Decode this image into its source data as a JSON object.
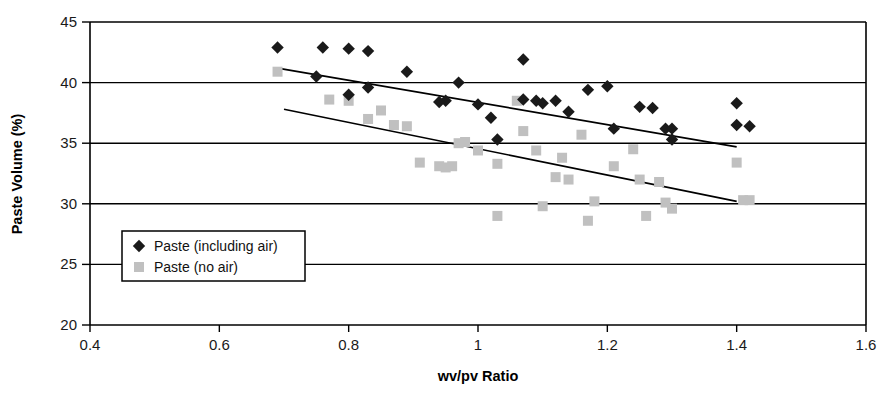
{
  "chart_data": {
    "type": "scatter",
    "title": "",
    "xlabel": "wv/pv Ratio",
    "ylabel": "Paste Volume (%)",
    "xlim": [
      0.4,
      1.6
    ],
    "ylim": [
      20,
      45
    ],
    "xticks": [
      "0.4",
      "0.6",
      "0.8",
      "1",
      "1.2",
      "1.4",
      "1.6"
    ],
    "xtick_values": [
      0.4,
      0.6,
      0.8,
      1.0,
      1.2,
      1.4,
      1.6
    ],
    "yticks": [
      "20",
      "25",
      "30",
      "35",
      "40",
      "45"
    ],
    "ytick_values": [
      20,
      25,
      30,
      35,
      40,
      45
    ],
    "grid": "horizontal",
    "legend_position": "lower-left-inside",
    "series": [
      {
        "name": "Paste (including air)",
        "marker": "diamond",
        "color": "#1a1a1a",
        "points": [
          [
            0.69,
            42.9
          ],
          [
            0.76,
            42.9
          ],
          [
            0.8,
            42.8
          ],
          [
            0.83,
            42.6
          ],
          [
            0.75,
            40.5
          ],
          [
            0.8,
            39.0
          ],
          [
            0.83,
            39.6
          ],
          [
            0.89,
            40.9
          ],
          [
            0.95,
            38.5
          ],
          [
            0.94,
            38.4
          ],
          [
            0.97,
            40.0
          ],
          [
            1.0,
            38.2
          ],
          [
            1.02,
            37.1
          ],
          [
            1.03,
            35.3
          ],
          [
            1.07,
            41.9
          ],
          [
            1.07,
            38.6
          ],
          [
            1.09,
            38.5
          ],
          [
            1.1,
            38.3
          ],
          [
            1.12,
            38.5
          ],
          [
            1.14,
            37.6
          ],
          [
            1.17,
            39.4
          ],
          [
            1.2,
            39.7
          ],
          [
            1.21,
            36.2
          ],
          [
            1.25,
            38.0
          ],
          [
            1.27,
            37.9
          ],
          [
            1.29,
            36.2
          ],
          [
            1.3,
            36.2
          ],
          [
            1.3,
            35.3
          ],
          [
            1.4,
            38.3
          ],
          [
            1.4,
            36.5
          ],
          [
            1.42,
            36.4
          ]
        ]
      },
      {
        "name": "Paste (no air)",
        "marker": "square",
        "color": "#c0c0c0",
        "points": [
          [
            0.69,
            40.9
          ],
          [
            0.77,
            38.6
          ],
          [
            0.8,
            38.5
          ],
          [
            0.83,
            37.0
          ],
          [
            0.85,
            37.7
          ],
          [
            0.87,
            36.5
          ],
          [
            0.89,
            36.4
          ],
          [
            0.91,
            33.4
          ],
          [
            0.94,
            33.1
          ],
          [
            0.95,
            33.0
          ],
          [
            0.96,
            33.1
          ],
          [
            0.97,
            35.0
          ],
          [
            0.98,
            35.1
          ],
          [
            1.0,
            34.4
          ],
          [
            1.03,
            33.3
          ],
          [
            1.03,
            29.0
          ],
          [
            1.06,
            38.5
          ],
          [
            1.07,
            36.0
          ],
          [
            1.09,
            34.4
          ],
          [
            1.1,
            29.8
          ],
          [
            1.12,
            32.2
          ],
          [
            1.13,
            33.8
          ],
          [
            1.14,
            32.0
          ],
          [
            1.16,
            35.7
          ],
          [
            1.17,
            28.6
          ],
          [
            1.18,
            30.2
          ],
          [
            1.21,
            33.1
          ],
          [
            1.24,
            34.5
          ],
          [
            1.25,
            32.0
          ],
          [
            1.26,
            29.0
          ],
          [
            1.28,
            31.8
          ],
          [
            1.29,
            30.1
          ],
          [
            1.3,
            29.6
          ],
          [
            1.4,
            33.4
          ],
          [
            1.41,
            30.3
          ],
          [
            1.42,
            30.3
          ]
        ]
      }
    ],
    "trendlines": [
      {
        "name": "Paste (including air) trendline",
        "color": "#000000",
        "x0": 0.69,
        "y0": 41.2,
        "x1": 1.4,
        "y1": 34.7
      },
      {
        "name": "Paste (no air) trendline",
        "color": "#000000",
        "x0": 0.7,
        "y0": 37.8,
        "x1": 1.4,
        "y1": 30.2
      }
    ]
  },
  "legend": {
    "items": [
      {
        "label": "Paste (including air)",
        "marker": "diamond",
        "color": "#1a1a1a"
      },
      {
        "label": "Paste (no air)",
        "marker": "square",
        "color": "#c0c0c0"
      }
    ]
  }
}
